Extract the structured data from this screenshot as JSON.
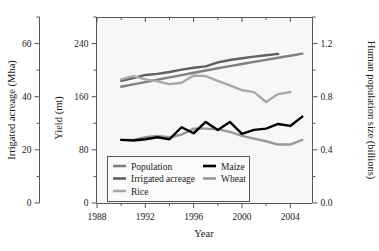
{
  "chart_data": {
    "type": "line",
    "title": "",
    "xlabel": "Year",
    "ylabel_left_outer": "Irrigated acreage (Mha)",
    "ylabel_left_inner": "Yield (mt)",
    "ylabel_right": "Human population size (billions)",
    "x": [
      1990,
      1991,
      1992,
      1993,
      1994,
      1995,
      1996,
      1997,
      1998,
      1999,
      2000,
      2001,
      2002,
      2003,
      2004,
      2005
    ],
    "xlim": [
      1988,
      2005.8
    ],
    "xticks": [
      1988,
      1992,
      1996,
      2000,
      2004
    ],
    "xticklabels": [
      "1988",
      "1992",
      "1996",
      "2000",
      "2004"
    ],
    "xminorticks": [
      1990,
      1994,
      1998,
      2002
    ],
    "axis_left_outer": {
      "label": "Irrigated acreage (Mha)",
      "lim": [
        0,
        70
      ],
      "ticks": [
        0,
        20,
        40,
        60
      ],
      "ticklabels": [
        "0",
        "20",
        "40",
        "60"
      ],
      "minorticks": [
        10,
        30,
        50,
        70
      ]
    },
    "axis_left_inner": {
      "label": "Yield (mt)",
      "lim": [
        0,
        280
      ],
      "ticks": [
        0,
        80,
        160,
        240
      ],
      "ticklabels": [
        "0",
        "80",
        "160",
        "240"
      ],
      "minorticks": [
        40,
        120,
        200,
        280
      ]
    },
    "axis_right": {
      "label": "Human population size (billions)",
      "lim": [
        0.0,
        1.4
      ],
      "ticks": [
        0.0,
        0.4,
        0.8,
        1.2
      ],
      "ticklabels": [
        "0.0",
        "0.4",
        "0.8",
        "1.2"
      ],
      "minorticks": [
        0.2,
        0.6,
        1.0,
        1.4
      ]
    },
    "grid": false,
    "legend_position": "lower-left-inside",
    "series": [
      {
        "name": "Population",
        "color": "#808080",
        "width": 2.4,
        "axis": "right",
        "units": "billions",
        "values": [
          0.875,
          0.893,
          0.91,
          0.928,
          0.946,
          0.963,
          0.98,
          0.997,
          1.014,
          1.03,
          1.046,
          1.062,
          1.077,
          1.093,
          1.108,
          1.124
        ]
      },
      {
        "name": "Irrigated acreage",
        "color": "#606060",
        "width": 2.4,
        "axis": "left-outer",
        "units": "Mha",
        "values": [
          46.0,
          47.0,
          48.2,
          48.6,
          49.3,
          50.2,
          50.9,
          51.4,
          52.9,
          53.8,
          54.5,
          55.1,
          55.6,
          56.1,
          null,
          null
        ]
      },
      {
        "name": "Rice",
        "color": "#a8a8a8",
        "width": 2.4,
        "axis": "left-inner",
        "units": "mt",
        "values": [
          186,
          191,
          186,
          183,
          179,
          181,
          192,
          191,
          184,
          177,
          170,
          167,
          152,
          164,
          167,
          null
        ]
      },
      {
        "name": "Maize",
        "color": "#000000",
        "width": 2.4,
        "axis": "left-inner",
        "units": "mt",
        "values": [
          95,
          94,
          96,
          99,
          96,
          114,
          105,
          122,
          110,
          122,
          104,
          110,
          112,
          119,
          116,
          130
        ]
      },
      {
        "name": "Wheat",
        "color": "#999999",
        "width": 2.4,
        "axis": "left-inner",
        "units": "mt",
        "values": [
          95,
          95,
          99,
          101,
          99,
          103,
          112,
          112,
          111,
          107,
          101,
          97,
          93,
          88,
          88,
          95
        ]
      }
    ],
    "legend_entries": [
      {
        "label": "Population",
        "color": "#808080",
        "column": 0,
        "row": 0
      },
      {
        "label": "Irrigated acreage",
        "color": "#606060",
        "column": 0,
        "row": 1
      },
      {
        "label": "Rice",
        "color": "#a8a8a8",
        "column": 0,
        "row": 2
      },
      {
        "label": "Maize",
        "color": "#000000",
        "column": 1,
        "row": 0
      },
      {
        "label": "Wheat",
        "color": "#999999",
        "column": 1,
        "row": 1
      }
    ]
  },
  "labels": {
    "x_axis": "Year",
    "y_outer": "Irrigated acreage (Mha)",
    "y_inner": "Yield (mt)",
    "y_right": "Human population size (billions)"
  },
  "ticktext": {
    "outer": [
      "60",
      "40",
      "20",
      "0"
    ],
    "inner": [
      "240",
      "160",
      "80",
      "0"
    ],
    "right": [
      "1.2",
      "0.8",
      "0.4",
      "0.0"
    ],
    "x": [
      "1988",
      "1992",
      "1996",
      "2000",
      "2004"
    ]
  },
  "colors": {
    "population": "#808080",
    "irrigated": "#606060",
    "rice": "#a8a8a8",
    "maize": "#000000",
    "wheat": "#999999",
    "axis": "#555555",
    "text": "#1a1a1a",
    "plot_bg": "#f7f7f7",
    "page_bg": "#ffffff"
  }
}
